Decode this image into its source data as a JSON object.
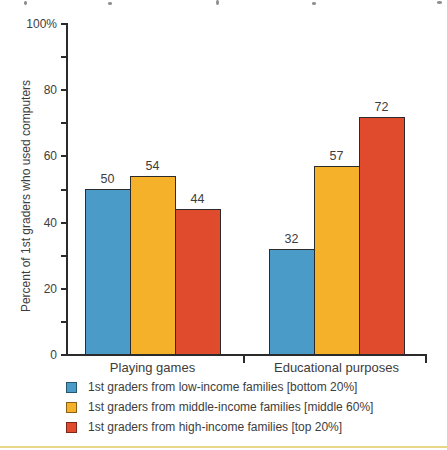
{
  "figure": {
    "ylabel": "Percent of 1st graders who used computers"
  },
  "chart_data": {
    "type": "bar",
    "categories": [
      "Playing games",
      "Educational purposes"
    ],
    "series": [
      {
        "name": "1st graders from low-income families [bottom 20%]",
        "color": "#4a9bc8",
        "values": [
          50,
          32
        ]
      },
      {
        "name": "1st graders from middle-income families [middle 60%]",
        "color": "#f5b12a",
        "values": [
          54,
          57
        ]
      },
      {
        "name": "1st graders from high-income families [top 20%]",
        "color": "#e04a2d",
        "values": [
          44,
          72
        ]
      }
    ],
    "title": "",
    "xlabel": "",
    "ylabel": "Percent of 1st graders who used computers",
    "ylim": [
      0,
      100
    ],
    "yticks_major": [
      0,
      20,
      40,
      60,
      80,
      100
    ],
    "ytick_labels": [
      "0",
      "20",
      "40",
      "60",
      "80",
      "100%"
    ],
    "yticks_minor": [
      10,
      30,
      50,
      70,
      90
    ],
    "grid": false,
    "legend_position": "bottom",
    "bar_value_labels": [
      [
        50,
        54,
        44
      ],
      [
        32,
        57,
        72
      ]
    ]
  },
  "colors": {
    "axis": "#2b2b2b",
    "text": "#3d3d3d",
    "bar_outline": "#2b2b2b",
    "page_bottom_rule": "#e9d687",
    "background": "#ffffff"
  }
}
